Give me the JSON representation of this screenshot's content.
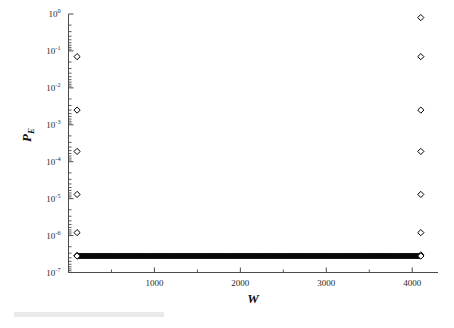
{
  "figure": {
    "background": "#ffffff",
    "marker_shape": "open-diamond",
    "marker_color": "#000000",
    "dense_band_color": "#111111"
  },
  "axes": {
    "x": {
      "label": "W",
      "min": 0,
      "max": 4300,
      "tick_values": [
        1000,
        2000,
        3000,
        4000
      ],
      "tick_labels": [
        "1000",
        "2000",
        "3000",
        "4000"
      ],
      "minor_tick_values": [
        500,
        1500,
        2500,
        3500
      ],
      "scale": "linear"
    },
    "y": {
      "label": "P",
      "label_subscript": "E",
      "scale": "log",
      "min": 1e-07,
      "max": 1,
      "tick_labels": [
        {
          "mantissa": "10",
          "exponent": "0"
        },
        {
          "mantissa": "10",
          "exponent": "-1"
        },
        {
          "mantissa": "10",
          "exponent": "-2"
        },
        {
          "mantissa": "10",
          "exponent": "-3"
        },
        {
          "mantissa": "10",
          "exponent": "-4"
        },
        {
          "mantissa": "10",
          "exponent": "-5"
        },
        {
          "mantissa": "10",
          "exponent": "-6"
        },
        {
          "mantissa": "10",
          "exponent": "-7"
        }
      ]
    }
  },
  "chart_data": {
    "type": "scatter",
    "title": "",
    "xlabel": "W",
    "ylabel": "P_E",
    "xlim": [
      0,
      4300
    ],
    "ylim": [
      1e-07,
      1
    ],
    "xscale": "linear",
    "yscale": "log",
    "grid": false,
    "legend": null,
    "series": [
      {
        "name": "left-cluster",
        "marker": "open-diamond",
        "x": [
          100,
          100,
          100,
          100,
          100,
          100
        ],
        "y": [
          0.07,
          0.0025,
          0.00019,
          1.3e-05,
          1.2e-06,
          2.9e-07
        ]
      },
      {
        "name": "right-cluster",
        "marker": "open-diamond",
        "x": [
          4100,
          4100,
          4100,
          4100,
          4100,
          4100,
          4100
        ],
        "y": [
          0.8,
          0.07,
          0.0025,
          0.00019,
          1.3e-05,
          1.2e-06,
          3e-07
        ]
      },
      {
        "name": "floor-band",
        "marker": "filled-diamond",
        "description": "dense horizontal band of overlapping markers spanning full W range",
        "y_constant": 2.8e-07,
        "x_start": 100,
        "x_end": 4100,
        "point_count": 220
      }
    ]
  }
}
